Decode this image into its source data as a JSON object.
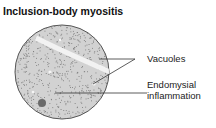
{
  "diagram": {
    "title": "Inclusion-body myositis",
    "labels": {
      "vacuoles": "Vacuoles",
      "endomysial_line1": "Endomysial",
      "endomysial_line2": "inflammation"
    },
    "colors": {
      "tissue": "#d2d2d2",
      "outline": "#555555",
      "stipple": "#7a7a7a",
      "vacuole": "#f2f2f2",
      "cell": "#6a6a6a",
      "leader": "#333333"
    }
  }
}
